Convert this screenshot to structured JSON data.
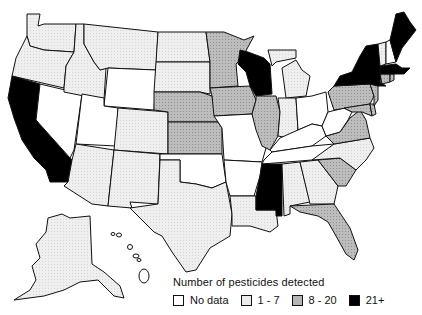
{
  "map": {
    "title": "Number of pesticides detected",
    "region": "United States",
    "colors": {
      "no_data": "#ffffff",
      "range_1_7": "#ececec",
      "range_8_20": "#b5b5b5",
      "range_21_plus": "#000000",
      "border": "#111111"
    },
    "legend": {
      "title": "Number of pesticides detected",
      "items": [
        {
          "label": "No data",
          "category": "no_data",
          "color": "#ffffff"
        },
        {
          "label": "1 - 7",
          "category": "1-7",
          "color": "#ececec"
        },
        {
          "label": "8 - 20",
          "category": "8-20",
          "color": "#b5b5b5"
        },
        {
          "label": "21+",
          "category": "21+",
          "color": "#000000"
        }
      ]
    },
    "states": {
      "WA": "1-7",
      "OR": "1-7",
      "CA": "21+",
      "ID": "1-7",
      "NV": "no_data",
      "MT": "1-7",
      "WY": "no_data",
      "UT": "no_data",
      "AZ": "1-7",
      "CO": "1-7",
      "NM": "1-7",
      "ND": "1-7",
      "SD": "1-7",
      "NE": "8-20",
      "KS": "8-20",
      "OK": "no_data",
      "TX": "1-7",
      "MN": "8-20",
      "IA": "8-20",
      "MO": "no_data",
      "AR": "no_data",
      "LA": "1-7",
      "WI": "21+",
      "IL": "8-20",
      "MI": "1-7",
      "IN": "1-7",
      "OH": "no_data",
      "KY": "no_data",
      "TN": "no_data",
      "MS": "21+",
      "AL": "1-7",
      "GA": "1-7",
      "FL": "8-20",
      "SC": "8-20",
      "NC": "1-7",
      "VA": "8-20",
      "WV": "no_data",
      "PA": "8-20",
      "NY": "21+",
      "VT": "1-7",
      "NH": "no_data",
      "ME": "21+",
      "MA": "21+",
      "CT": "8-20",
      "RI": "8-20",
      "NJ": "8-20",
      "DE": "8-20",
      "MD": "8-20",
      "AK": "1-7",
      "HI": "no_data"
    }
  }
}
